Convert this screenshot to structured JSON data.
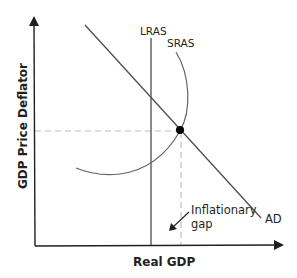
{
  "diagram": {
    "type": "AD-AS model",
    "x_axis": {
      "label": "Real GDP"
    },
    "y_axis": {
      "label": "GDP Price Deflator"
    },
    "curves": [
      {
        "id": "lras",
        "label": "LRAS",
        "shape": "vertical line"
      },
      {
        "id": "sras",
        "label": "SRAS",
        "shape": "arc"
      },
      {
        "id": "ad",
        "label": "AD",
        "shape": "downward sloping line"
      }
    ],
    "equilibrium_point": {
      "marker": "filled-circle",
      "description": "AD intersects SRAS to the right of LRAS"
    },
    "guides": [
      "dashed horizontal to y-axis",
      "dashed vertical to x-axis"
    ],
    "annotation": {
      "line1": "Inflationary",
      "line2": "gap",
      "icon": "arrow-down-left-icon"
    },
    "colors": {
      "ink": "#231f20",
      "curve": "#595959",
      "dashed": "#bdbdbd",
      "dot": "#000000",
      "background": "#ffffff"
    }
  }
}
